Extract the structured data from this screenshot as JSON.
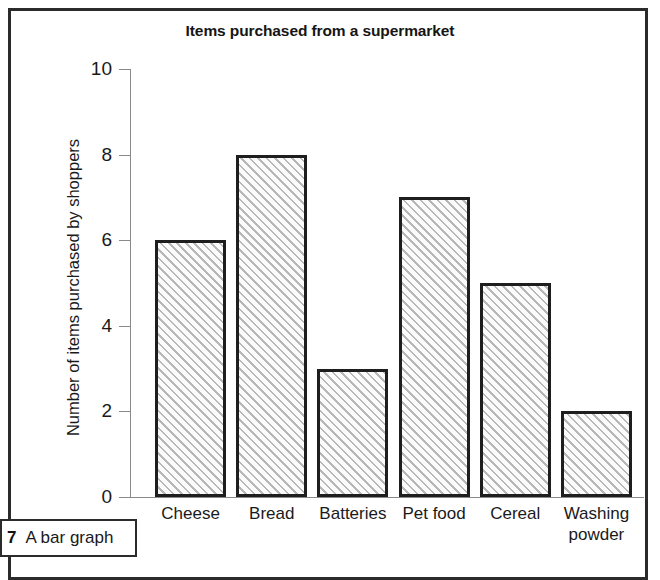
{
  "figure": {
    "caption_number": "7",
    "caption_text": "A bar graph",
    "frame_color": "#2b2b2b"
  },
  "chart_data": {
    "type": "bar",
    "title": "Items purchased from a supermarket",
    "xlabel": "",
    "ylabel": "Number of items purchased by shoppers",
    "categories": [
      "Cheese",
      "Bread",
      "Batteries",
      "Pet food",
      "Cereal",
      "Washing powder"
    ],
    "values": [
      6,
      8,
      3,
      7,
      5,
      2
    ],
    "ylim": [
      0,
      10
    ],
    "ytick_labels": [
      "0",
      "2",
      "4",
      "6",
      "8",
      "10"
    ],
    "ytick_values": [
      0,
      2,
      4,
      6,
      8,
      10
    ],
    "grid": false,
    "legend": "none",
    "bar_fill": "hatched-diagonal",
    "bar_edge_color": "#1e1e1e",
    "axis_color": "#8a8a8a"
  }
}
